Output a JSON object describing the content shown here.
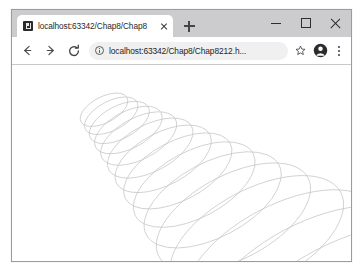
{
  "window": {
    "controls": {
      "minimize": "minimize-button",
      "maximize": "maximize-button",
      "close": "close-button"
    }
  },
  "tabstrip": {
    "tabs": [
      {
        "title": "localhost:63342/Chap8/Chap8",
        "favicon": "page-favicon",
        "active": true
      }
    ],
    "new_tab_label": "+"
  },
  "toolbar": {
    "back_label": "←",
    "forward_label": "→",
    "reload_label": "↻",
    "address": {
      "url": "localhost:63342/Chap8/Chap8212.h...",
      "placeholder": "Search Google or type a URL",
      "site_info_icon": "info-circle-icon"
    },
    "bookmark_icon": "star-icon",
    "profile_icon": "account-avatar-icon",
    "menu_icon": "three-dot-menu-icon"
  },
  "page": {
    "background": "#ffffff",
    "drawing": {
      "name": "expanding-elliptical-spiral",
      "stroke": "#c0c0c0",
      "stroke_width": 0.65,
      "count": 15,
      "start": {
        "cx": 92,
        "cy": 45,
        "rx": 26,
        "ry": 13,
        "rotation": -28
      },
      "growth": 1.125,
      "step": {
        "dx": 7.2,
        "dy": 6.0
      }
    }
  }
}
